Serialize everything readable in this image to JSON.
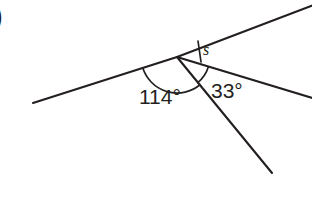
{
  "page": {
    "background_color": "#ffffff",
    "ink_color": "#231f20",
    "problem_marker": ")"
  },
  "figure": {
    "vertex": {
      "x": 177,
      "y": 57
    },
    "rays": [
      {
        "name": "left-ray",
        "from": {
          "x": 177,
          "y": 57
        },
        "to": {
          "x": 33,
          "y": 103
        }
      },
      {
        "name": "upper-right-ray",
        "from": {
          "x": 177,
          "y": 57
        },
        "to": {
          "x": 316,
          "y": 4
        }
      },
      {
        "name": "right-ray",
        "from": {
          "x": 177,
          "y": 57
        },
        "to": {
          "x": 316,
          "y": 99
        }
      },
      {
        "name": "lower-right-ray",
        "from": {
          "x": 177,
          "y": 57
        },
        "to": {
          "x": 272,
          "y": 173
        }
      }
    ],
    "arcs": [
      {
        "name": "arc-114",
        "radius": 36,
        "start_angle_deg": 162,
        "end_angle_deg": 309
      },
      {
        "name": "arc-33",
        "radius": 33,
        "start_angle_deg": 309,
        "end_angle_deg": 343
      }
    ],
    "tick": {
      "name": "s-angle-tick",
      "from": {
        "x": 198,
        "y": 42
      },
      "to": {
        "x": 201,
        "y": 62
      }
    }
  },
  "labels": {
    "angle_114": "114°",
    "angle_33": "33°",
    "angle_s": "s"
  },
  "values": {
    "known_angle_1": 114,
    "known_angle_2": 33,
    "unknown_angle_symbol": "s",
    "unit": "degrees"
  }
}
